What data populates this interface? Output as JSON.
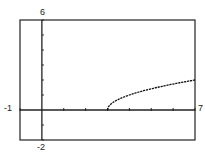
{
  "chart_data": {
    "type": "line",
    "title": "",
    "xlabel": "",
    "ylabel": "",
    "xlim": [
      -1,
      7
    ],
    "ylim": [
      -2,
      6
    ],
    "x_tick_step": 1,
    "y_tick_step": 1,
    "grid": false,
    "legend": null,
    "series": [
      {
        "name": "y = sqrt(x - 3)",
        "x": [
          3,
          3.5,
          4,
          4.5,
          5,
          5.5,
          6,
          6.5,
          7
        ],
        "values": [
          0,
          0.71,
          1,
          1.22,
          1.41,
          1.58,
          1.73,
          1.87,
          2
        ]
      }
    ],
    "window_labels": {
      "xmin": "-1",
      "xmax": "7",
      "ymin": "-2",
      "ymax": "6"
    }
  },
  "colors": {
    "frame": "#222222",
    "axis": "#222222",
    "curve": "#111111",
    "background": "#ffffff"
  }
}
